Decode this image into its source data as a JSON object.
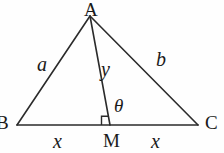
{
  "figure": {
    "background_color": "#fefefe",
    "stroke_color": "#2b2b2b",
    "text_color": "#1a1a1a",
    "vertices": {
      "A": {
        "label": "A",
        "x": 90,
        "y": 16,
        "label_x": 90,
        "label_y": 10
      },
      "B": {
        "label": "B",
        "x": 17,
        "y": 125,
        "label_x": 3,
        "label_y": 124
      },
      "C": {
        "label": "C",
        "x": 198,
        "y": 125,
        "label_x": 212,
        "label_y": 124
      },
      "M": {
        "label": "M",
        "x": 110,
        "y": 125,
        "label_x": 111,
        "label_y": 141
      }
    },
    "segment_labels": [
      {
        "name": "side-a",
        "text": "a",
        "x": 43,
        "y": 65
      },
      {
        "name": "side-b",
        "text": "b",
        "x": 161,
        "y": 60
      },
      {
        "name": "median-y",
        "text": "y",
        "x": 106,
        "y": 70
      },
      {
        "name": "base-left-x",
        "text": "x",
        "x": 58,
        "y": 141
      },
      {
        "name": "base-right-x",
        "text": "x",
        "x": 156,
        "y": 141
      }
    ],
    "angle_label": {
      "name": "theta",
      "text": "θ",
      "x": 120,
      "y": 106
    },
    "right_angle_marker": {
      "present": true,
      "at_vertex": "M",
      "size": 9,
      "side": "left"
    }
  }
}
